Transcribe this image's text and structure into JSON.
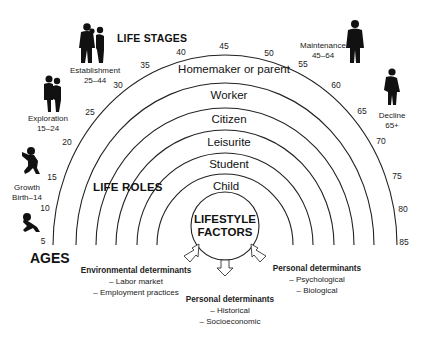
{
  "diagram": {
    "type": "life-career rainbow",
    "headings": {
      "life_stages": "LIFE STAGES",
      "life_roles": "LIFE ROLES",
      "ages": "AGES"
    },
    "life_roles": [
      {
        "label": "Homemaker or parent"
      },
      {
        "label": "Worker"
      },
      {
        "label": "Citizen"
      },
      {
        "label": "Leisurite"
      },
      {
        "label": "Student"
      },
      {
        "label": "Child"
      }
    ],
    "ages": [
      "5",
      "10",
      "15",
      "20",
      "25",
      "30",
      "35",
      "40",
      "45",
      "50",
      "55",
      "60",
      "65",
      "70",
      "75",
      "80",
      "85"
    ],
    "life_stages": [
      {
        "name": "Growth",
        "range": "Birth–14",
        "icon": "crawling-baby-icon"
      },
      {
        "name": "Exploration",
        "range": "15–24",
        "icon": "young-couple-icon"
      },
      {
        "name": "Establishment",
        "range": "25–44",
        "icon": "family-icon"
      },
      {
        "name": "Maintenance",
        "range": "45–64",
        "icon": "standing-man-icon"
      },
      {
        "name": "Decline",
        "range": "65+",
        "icon": "elderly-person-icon"
      }
    ],
    "center": {
      "line1": "LIFESTYLE",
      "line2": "FACTORS"
    },
    "determinants": [
      {
        "title": "Environmental determinants",
        "items": [
          "– Labor market",
          "– Employment practices"
        ]
      },
      {
        "title": "Personal determinants",
        "items": [
          "– Historical",
          "– Socioeconomic"
        ]
      },
      {
        "title": "Personal determinants",
        "items": [
          "– Psychological",
          "– Biological"
        ]
      }
    ],
    "colors": {
      "line": "#222222",
      "text": "#111111",
      "background": "#ffffff"
    }
  }
}
